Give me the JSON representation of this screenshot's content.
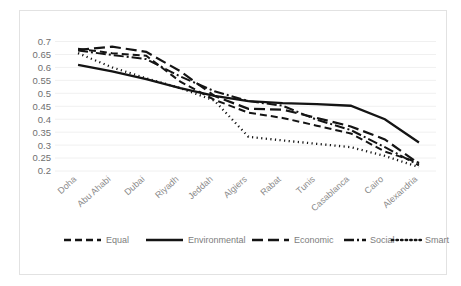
{
  "chart_data": {
    "type": "line",
    "title": "",
    "xlabel": "",
    "ylabel": "",
    "ylim": [
      0.2,
      0.7
    ],
    "yticks": [
      0.7,
      0.65,
      0.6,
      0.55,
      0.5,
      0.45,
      0.4,
      0.35,
      0.3,
      0.25,
      0.2
    ],
    "ytick_labels": [
      "0.7",
      "0.65",
      "0.6",
      "0.55",
      "0.5",
      "0.45",
      "0.4",
      "0.35",
      "0.3",
      "0.25",
      "0.2"
    ],
    "grid": true,
    "legend_position": "bottom",
    "categories": [
      "Doha",
      "Abu Ahabi",
      "Dubai",
      "Riyadh",
      "Jeddah",
      "Algiers",
      "Rabat",
      "Tunis",
      "Casablanca",
      "Cairo",
      "Alexandria"
    ],
    "series": [
      {
        "name": "Equal",
        "style": "dashed",
        "color": "#141414",
        "width": 2.0,
        "dash": "7,4",
        "values": [
          0.672,
          0.655,
          0.645,
          0.545,
          0.475,
          0.425,
          0.405,
          0.375,
          0.345,
          0.275,
          0.232
        ]
      },
      {
        "name": "Environmental",
        "style": "solid",
        "color": "#141414",
        "width": 2.3,
        "dash": "none",
        "values": [
          0.61,
          0.585,
          0.555,
          0.52,
          0.49,
          0.47,
          0.462,
          0.458,
          0.452,
          0.4,
          0.31
        ]
      },
      {
        "name": "Economic",
        "style": "long-dash",
        "color": "#141414",
        "width": 2.2,
        "dash": "11,5",
        "values": [
          0.668,
          0.68,
          0.66,
          0.585,
          0.49,
          0.44,
          0.437,
          0.405,
          0.372,
          0.322,
          0.228
        ]
      },
      {
        "name": "Social",
        "style": "dash-dot",
        "color": "#141414",
        "width": 2.0,
        "dash": "10,3,2,3",
        "values": [
          0.665,
          0.648,
          0.632,
          0.565,
          0.508,
          0.47,
          0.452,
          0.398,
          0.358,
          0.292,
          0.222
        ]
      },
      {
        "name": "Smart",
        "style": "dotted",
        "color": "#141414",
        "width": 2.3,
        "dash": "1.2,3.4",
        "values": [
          0.655,
          0.6,
          0.558,
          0.52,
          0.472,
          0.332,
          0.318,
          0.305,
          0.292,
          0.258,
          0.215
        ]
      }
    ]
  },
  "legend": {
    "items": [
      {
        "label": "Equal"
      },
      {
        "label": "Environmental"
      },
      {
        "label": "Economic"
      },
      {
        "label": "Social"
      },
      {
        "label": "Smart"
      }
    ]
  },
  "colors": {
    "frame_border": "#e2e2e2",
    "gridline": "#f0f0f0",
    "axis_text": "#6f6f6f",
    "category_text": "#8a8a8a",
    "legend_text": "#7d7d7d",
    "series_ink": "#141414",
    "background": "#ffffff"
  }
}
